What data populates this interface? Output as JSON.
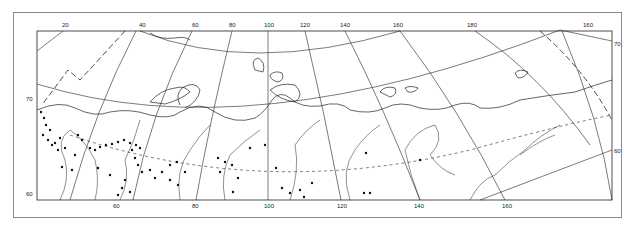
{
  "map": {
    "projection": "conic",
    "region": "Northern Eurasia / Siberia",
    "colors": {
      "line": "#222222",
      "frame": "#8a8a8a",
      "background": "#ffffff",
      "dot": "#111111"
    },
    "top_longitude_labels": [
      "20",
      "40",
      "60",
      "80",
      "100",
      "120",
      "140",
      "160",
      "180",
      "160"
    ],
    "bottom_longitude_labels": [
      "60",
      "80",
      "100",
      "120",
      "140",
      "160"
    ],
    "left_latitude_labels": [
      "70",
      "60"
    ],
    "right_latitude_labels": [
      "70",
      "60"
    ],
    "parallels": [
      {
        "lat": "70",
        "style": "solid"
      },
      {
        "lat": "65",
        "style": "dashed"
      },
      {
        "lat": "60",
        "style": "solid"
      }
    ],
    "boundary_line": {
      "style": "long-dashed"
    },
    "symbols": {
      "dot": "observation-site"
    }
  }
}
